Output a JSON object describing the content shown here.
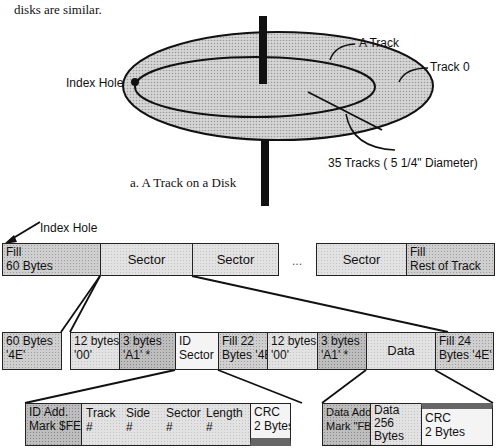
{
  "intro_text": "disks are similar.",
  "disk_figure": {
    "caption": "a. A Track on a Disk",
    "labels": {
      "index_hole": "Index Hole",
      "a_track": "A Track",
      "track0": "Track 0",
      "tracks_count": "35 Tracks ( 5 1/4\" Diameter)"
    }
  },
  "track_layout": {
    "index_hole_label": "Index Hole",
    "row1": [
      {
        "line1": "Fill",
        "line2": "60 Bytes"
      },
      {
        "label": "Sector"
      },
      {
        "label": "Sector"
      },
      {
        "label": "..."
      },
      {
        "label": "Sector"
      },
      {
        "line1": "Fill",
        "line2": "Rest of Track"
      }
    ],
    "row2": [
      {
        "line1": "60 Bytes",
        "line2": "'4E'"
      },
      {
        "line1": "12 bytes",
        "line2": "'00'"
      },
      {
        "line1": "3 bytes",
        "line2": "'A1' *"
      },
      {
        "line1": "ID",
        "line2": "Sector"
      },
      {
        "line1": "Fill 22",
        "line2": "Bytes '4E'"
      },
      {
        "line1": "12 bytes",
        "line2": "'00'"
      },
      {
        "line1": "3 bytes",
        "line2": "'A1' *"
      },
      {
        "label": "Data"
      },
      {
        "line1": "Fill 24",
        "line2": "Bytes '4E'"
      }
    ],
    "id_field": {
      "mark": {
        "line1": "ID Add.",
        "line2": "Mark $FE"
      },
      "fields": [
        {
          "name": "Track",
          "value": "#"
        },
        {
          "name": "Side",
          "value": "#"
        },
        {
          "name": "Sector",
          "value": "#"
        },
        {
          "name": "Length",
          "value": "#"
        }
      ],
      "crc": {
        "line1": "CRC",
        "line2": "2 Bytes"
      }
    },
    "data_field": {
      "mark": {
        "line1": "Data Address",
        "line2": "Mark \"FB\""
      },
      "data": {
        "line1": "Data",
        "line2": "256",
        "line3": "Bytes"
      },
      "crc": {
        "line1": "CRC",
        "line2": "2 Bytes"
      }
    }
  }
}
